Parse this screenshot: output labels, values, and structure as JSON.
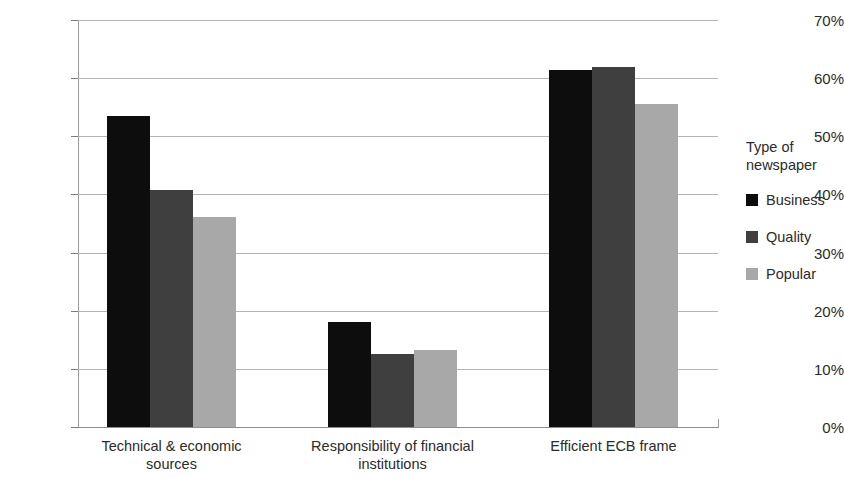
{
  "chart_data": {
    "type": "bar",
    "title": "",
    "xlabel": "",
    "ylabel": "",
    "ylim": [
      0,
      70
    ],
    "y_tick_step": 10,
    "y_tick_labels": [
      "0%",
      "10%",
      "20%",
      "30%",
      "40%",
      "50%",
      "60%",
      "70%"
    ],
    "grid": true,
    "legend_position": "right",
    "legend_title": "Type of\nnewspaper",
    "value_suffix": "%",
    "categories": [
      "Technical & economic sources",
      "Responsibility of financial institutions",
      "Efficient ECB frame"
    ],
    "category_lines": [
      [
        "Technical & economic",
        "sources"
      ],
      [
        "Responsibility of financial",
        "institutions"
      ],
      [
        "Efficient ECB frame"
      ]
    ],
    "series": [
      {
        "name": "Business",
        "color": "#0d0d0d",
        "values": [
          53.5,
          18.1,
          61.4
        ]
      },
      {
        "name": "Quality",
        "color": "#3f3f3f",
        "values": [
          40.8,
          12.6,
          62.0
        ]
      },
      {
        "name": "Popular",
        "color": "#a8a8a8",
        "values": [
          36.1,
          13.3,
          55.5
        ]
      }
    ]
  },
  "axis": {
    "tick_color": "#7d7d7d",
    "grid_color": "#b4b4b4",
    "spine_color": "#9a9a9a",
    "text_color": "#2b2b2b"
  }
}
